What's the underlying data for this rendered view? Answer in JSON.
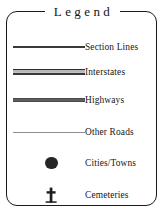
{
  "legend": {
    "title": "Legend",
    "border_color": "#1a1a1a",
    "background_color": "#ffffff",
    "text_color": "#161616",
    "entries": [
      {
        "label": "Section Lines",
        "symbol": "thin-line",
        "symbol_color": "#3a3a3a"
      },
      {
        "label": "Interstates",
        "symbol": "cased-double-line",
        "symbol_color": "#2e2e2e"
      },
      {
        "label": "Highways",
        "symbol": "thick-line",
        "symbol_color": "#5e5e5e"
      },
      {
        "label": "Other Roads",
        "symbol": "hairline",
        "symbol_color": "#8d8d8d"
      },
      {
        "label": "Cities/Towns",
        "symbol": "filled-circle",
        "symbol_color": "#262626"
      },
      {
        "label": "Cemeteries",
        "symbol": "cross",
        "symbol_color": "#1f1f1f"
      }
    ]
  }
}
